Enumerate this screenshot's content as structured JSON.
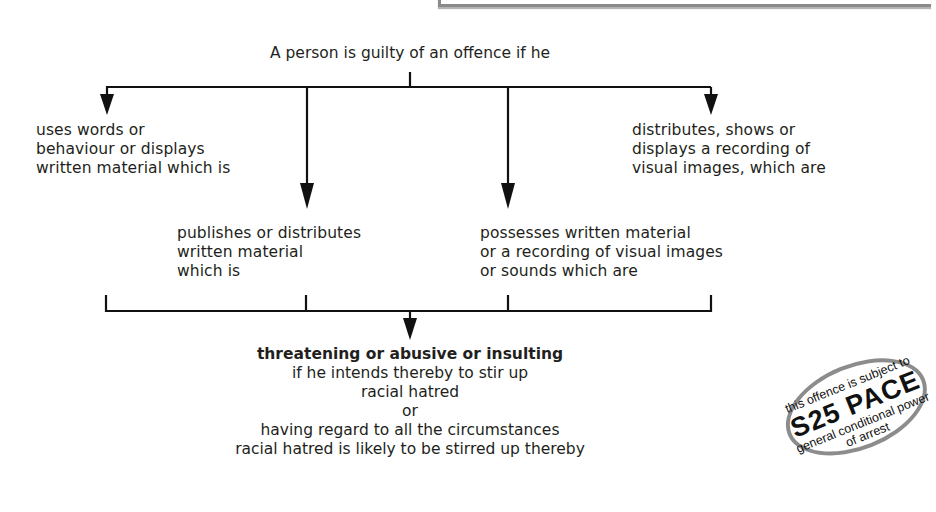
{
  "heading": "A person is guilty of an offence if he",
  "branches": [
    {
      "id": "uses-words",
      "lines": [
        "uses words or",
        "behaviour or displays",
        "written material which is"
      ]
    },
    {
      "id": "publishes",
      "lines": [
        "publishes or distributes",
        "written material",
        "which is"
      ]
    },
    {
      "id": "possesses",
      "lines": [
        "possesses written material",
        "or a recording of visual images",
        "or sounds which are"
      ]
    },
    {
      "id": "distributes-recording",
      "lines": [
        "distributes, shows or",
        "displays a recording of",
        "visual images, which are"
      ]
    }
  ],
  "result": {
    "bold_line": "threatening or abusive or insulting",
    "lines": [
      "if he intends thereby to stir up",
      "racial hatred",
      "or",
      "having regard to all the circumstances",
      "racial hatred is likely to be stirred up thereby"
    ]
  },
  "badge": {
    "line1": "this offence is subject to",
    "line2": "S25 PACE",
    "line3": "general conditional power",
    "line4": "of arrest"
  },
  "colors": {
    "text": "#231f20",
    "lines": "#1a1a1a",
    "badge_border": "#8c8c8c",
    "top_box_border": "#8a8a8a"
  }
}
